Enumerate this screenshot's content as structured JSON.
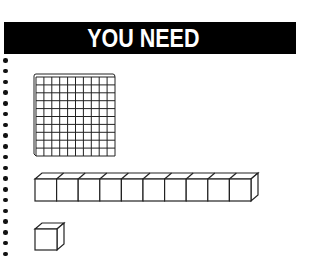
{
  "header": {
    "title": "YOU NEED",
    "background_color": "#000000",
    "text_color": "#ffffff"
  },
  "margin_dots": {
    "count": 19
  },
  "items": [
    {
      "name": "hundreds-flat",
      "description": "10 x 10 flat of base-ten blocks",
      "rows": 10,
      "cols": 10
    },
    {
      "name": "tens-rod",
      "description": "rod of 10 unit cubes",
      "cubes": 10
    },
    {
      "name": "unit-cube",
      "description": "single unit cube",
      "cubes": 1
    }
  ]
}
